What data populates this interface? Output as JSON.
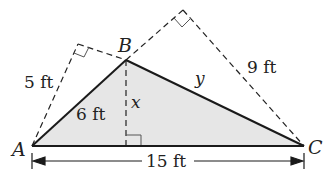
{
  "figure": {
    "vertices": {
      "A": "A",
      "B": "B",
      "C": "C"
    },
    "labels": {
      "AB_side": "6 ft",
      "BC_side": "y",
      "altitude": "x",
      "base": "15 ft",
      "left_projection": "5 ft",
      "right_projection": "9 ft"
    },
    "colors": {
      "fill": "#e6e6e6",
      "stroke": "#1a1a1a"
    }
  }
}
